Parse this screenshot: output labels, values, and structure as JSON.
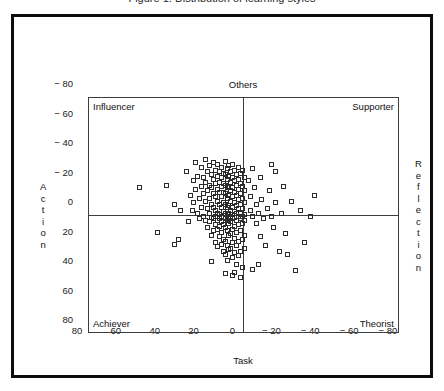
{
  "figure": {
    "title": "Figure 1. Distribution of learning styles",
    "axis_left_label": "Action",
    "axis_right_label": "Reflection",
    "axis_top_label": "Others",
    "axis_bottom_label": "Task"
  },
  "quadrants": {
    "top_left": "Influencer",
    "top_right": "Supporter",
    "bottom_left": "Achiever",
    "bottom_right": "Theorist"
  },
  "chart_data": {
    "type": "scatter",
    "title": "Figure 1. Distribution of learning styles",
    "xlabel": "Task",
    "ylabel": "Action",
    "xlabel_secondary": "Others",
    "ylabel_secondary": "Reflection",
    "xlim": [
      80,
      -80
    ],
    "ylim": [
      -80,
      80
    ],
    "x_inverted": true,
    "y_inverted": true,
    "grid": false,
    "legend": "none",
    "xticks": [
      80,
      60,
      40,
      20,
      0,
      -20,
      -40,
      -60,
      -80
    ],
    "xtick_labels": [
      "80",
      "60",
      "40",
      "20",
      "0",
      "− 20",
      "− 40",
      "− 60",
      "− 80"
    ],
    "yticks": [
      -80,
      -60,
      -40,
      -20,
      0,
      20,
      40,
      60,
      80
    ],
    "ytick_labels": [
      "− 80",
      "− 60",
      "− 40",
      "− 20",
      "0",
      "20",
      "40",
      "60",
      "80"
    ],
    "marker": "open-square",
    "marker_size": 5,
    "marker_color": "#2b2b2b",
    "quadrant_labels": {
      "top_left": "Influencer",
      "top_right": "Supporter",
      "bottom_left": "Achiever",
      "bottom_right": "Theorist"
    },
    "n_points": 196,
    "points": [
      [
        40,
        -21
      ],
      [
        36,
        -8
      ],
      [
        34,
        16
      ],
      [
        30,
        -30
      ],
      [
        28,
        -14
      ],
      [
        27,
        -4
      ],
      [
        26,
        -24
      ],
      [
        26,
        -9
      ],
      [
        25,
        -36
      ],
      [
        25,
        -18
      ],
      [
        24,
        -2
      ],
      [
        24,
        -27
      ],
      [
        23,
        -12
      ],
      [
        23,
        2
      ],
      [
        22,
        -33
      ],
      [
        22,
        -20
      ],
      [
        22,
        -6
      ],
      [
        21,
        -15
      ],
      [
        21,
        0
      ],
      [
        21,
        -26
      ],
      [
        20,
        -38
      ],
      [
        20,
        -23
      ],
      [
        20,
        -10
      ],
      [
        20,
        3
      ],
      [
        19,
        -30
      ],
      [
        19,
        -17
      ],
      [
        19,
        -5
      ],
      [
        19,
        8
      ],
      [
        18,
        -34
      ],
      [
        18,
        -21
      ],
      [
        18,
        -12
      ],
      [
        18,
        -2
      ],
      [
        18,
        4
      ],
      [
        17,
        -28
      ],
      [
        17,
        -19
      ],
      [
        17,
        -8
      ],
      [
        17,
        1
      ],
      [
        17,
        13
      ],
      [
        16,
        -36
      ],
      [
        16,
        -25
      ],
      [
        16,
        -15
      ],
      [
        16,
        -6
      ],
      [
        16,
        2
      ],
      [
        16,
        10
      ],
      [
        15,
        -31
      ],
      [
        15,
        -22
      ],
      [
        15,
        -13
      ],
      [
        15,
        -4
      ],
      [
        15,
        0
      ],
      [
        15,
        6
      ],
      [
        15,
        18
      ],
      [
        14,
        -35
      ],
      [
        14,
        -27
      ],
      [
        14,
        -18
      ],
      [
        14,
        -10
      ],
      [
        14,
        -2
      ],
      [
        14,
        3
      ],
      [
        14,
        9
      ],
      [
        14,
        21
      ],
      [
        13,
        -30
      ],
      [
        13,
        -23
      ],
      [
        13,
        -16
      ],
      [
        13,
        -8
      ],
      [
        13,
        -1
      ],
      [
        13,
        2
      ],
      [
        13,
        7
      ],
      [
        13,
        14
      ],
      [
        12,
        -33
      ],
      [
        12,
        -26
      ],
      [
        12,
        -20
      ],
      [
        12,
        -13
      ],
      [
        12,
        -6
      ],
      [
        12,
        0
      ],
      [
        12,
        4
      ],
      [
        12,
        11
      ],
      [
        12,
        19
      ],
      [
        11,
        -29
      ],
      [
        11,
        -22
      ],
      [
        11,
        -16
      ],
      [
        11,
        -9
      ],
      [
        11,
        -3
      ],
      [
        11,
        1
      ],
      [
        11,
        6
      ],
      [
        11,
        16
      ],
      [
        11,
        24
      ],
      [
        10,
        -37
      ],
      [
        10,
        -28
      ],
      [
        10,
        -21
      ],
      [
        10,
        -15
      ],
      [
        10,
        -8
      ],
      [
        10,
        -2
      ],
      [
        10,
        2
      ],
      [
        10,
        8
      ],
      [
        10,
        17
      ],
      [
        10,
        26
      ],
      [
        9,
        -32
      ],
      [
        9,
        -25
      ],
      [
        9,
        -19
      ],
      [
        9,
        -12
      ],
      [
        9,
        -6
      ],
      [
        9,
        -1
      ],
      [
        9,
        3
      ],
      [
        9,
        10
      ],
      [
        9,
        20
      ],
      [
        9,
        30
      ],
      [
        8,
        -34
      ],
      [
        8,
        -27
      ],
      [
        8,
        -20
      ],
      [
        8,
        -14
      ],
      [
        8,
        -7
      ],
      [
        8,
        -2
      ],
      [
        8,
        1
      ],
      [
        8,
        5
      ],
      [
        8,
        13
      ],
      [
        8,
        23
      ],
      [
        7,
        -30
      ],
      [
        7,
        -23
      ],
      [
        7,
        -17
      ],
      [
        7,
        -10
      ],
      [
        7,
        -4
      ],
      [
        7,
        0
      ],
      [
        7,
        4
      ],
      [
        7,
        12
      ],
      [
        7,
        22
      ],
      [
        6,
        -35
      ],
      [
        6,
        -26
      ],
      [
        6,
        -19
      ],
      [
        6,
        -13
      ],
      [
        6,
        -6
      ],
      [
        6,
        -1
      ],
      [
        6,
        2
      ],
      [
        6,
        9
      ],
      [
        6,
        18
      ],
      [
        6,
        28
      ],
      [
        5,
        -31
      ],
      [
        5,
        -24
      ],
      [
        5,
        -16
      ],
      [
        5,
        -9
      ],
      [
        5,
        -3
      ],
      [
        5,
        1
      ],
      [
        5,
        7
      ],
      [
        5,
        15
      ],
      [
        5,
        25
      ],
      [
        5,
        38
      ],
      [
        4,
        -28
      ],
      [
        4,
        -21
      ],
      [
        4,
        -14
      ],
      [
        4,
        -7
      ],
      [
        4,
        -2
      ],
      [
        4,
        3
      ],
      [
        4,
        11
      ],
      [
        4,
        20
      ],
      [
        4,
        33
      ],
      [
        3,
        -33
      ],
      [
        3,
        -25
      ],
      [
        3,
        -18
      ],
      [
        3,
        -11
      ],
      [
        3,
        -5
      ],
      [
        3,
        0
      ],
      [
        3,
        6
      ],
      [
        3,
        17
      ],
      [
        3,
        27
      ],
      [
        2,
        -29
      ],
      [
        2,
        -22
      ],
      [
        2,
        -15
      ],
      [
        2,
        -8
      ],
      [
        2,
        -2
      ],
      [
        2,
        2
      ],
      [
        2,
        10
      ],
      [
        2,
        24
      ],
      [
        1,
        -31
      ],
      [
        1,
        -20
      ],
      [
        1,
        -12
      ],
      [
        1,
        -5
      ],
      [
        1,
        0
      ],
      [
        1,
        5
      ],
      [
        1,
        16
      ],
      [
        1,
        35
      ],
      [
        0,
        -26
      ],
      [
        0,
        -17
      ],
      [
        0,
        -9
      ],
      [
        0,
        -1
      ],
      [
        0,
        3
      ],
      [
        0,
        13
      ],
      [
        0,
        22
      ],
      [
        -2,
        -24
      ],
      [
        -3,
        -13
      ],
      [
        -3,
        -4
      ],
      [
        -4,
        -32
      ],
      [
        -4,
        0
      ],
      [
        -5,
        -19
      ],
      [
        -6,
        -8
      ],
      [
        -6,
        5
      ],
      [
        -7,
        -2
      ],
      [
        -8,
        -26
      ],
      [
        -8,
        14
      ],
      [
        -9,
        -11
      ],
      [
        -10,
        2
      ],
      [
        -11,
        20
      ],
      [
        -12,
        -5
      ],
      [
        -13,
        -17
      ],
      [
        -14,
        0
      ],
      [
        -15,
        8
      ],
      [
        -16,
        -9
      ],
      [
        -18,
        24
      ],
      [
        -19,
        -2
      ],
      [
        -20,
        -20
      ],
      [
        -21,
        12
      ],
      [
        -24,
        -10
      ],
      [
        -26,
        37
      ],
      [
        -29,
        -4
      ],
      [
        -31,
        18
      ],
      [
        -34,
        0
      ],
      [
        -36,
        -14
      ],
      [
        54,
        -19
      ],
      [
        45,
        11
      ],
      [
        36,
        19
      ],
      [
        33,
        -4
      ],
      [
        29,
        4
      ],
      [
        -16,
        -30
      ],
      [
        -22,
        26
      ],
      [
        -14,
        -35
      ],
      [
        6,
        40
      ],
      [
        10,
        39
      ],
      [
        2,
        42
      ],
      [
        -4,
        36
      ],
      [
        17,
        31
      ],
      [
        -7,
        33
      ]
    ]
  }
}
